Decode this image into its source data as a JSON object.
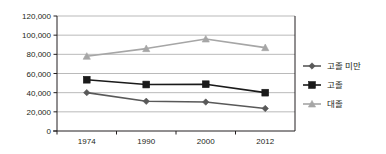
{
  "chart_data": {
    "type": "line",
    "title": "",
    "xlabel": "",
    "ylabel": "",
    "categories": [
      "1974",
      "1990",
      "2000",
      "2012"
    ],
    "ylim": [
      0,
      120000
    ],
    "ytick_values": [
      0,
      20000,
      40000,
      60000,
      80000,
      100000,
      120000
    ],
    "ytick_labels": [
      "0",
      "20,000",
      "40,000",
      "60,000",
      "80,000",
      "100,000",
      "120,000"
    ],
    "grid": true,
    "legend_position": "right",
    "series": [
      {
        "name": "고졸 미만",
        "marker": "diamond",
        "color": "#595959",
        "values": [
          40000,
          31000,
          30200,
          23500
        ]
      },
      {
        "name": "고졸",
        "marker": "square",
        "color": "#1a1a1a",
        "values": [
          53500,
          48500,
          48800,
          40000
        ]
      },
      {
        "name": "대졸",
        "marker": "triangle",
        "color": "#a6a6a6",
        "values": [
          78000,
          86000,
          96000,
          87000
        ]
      }
    ]
  },
  "axis": {
    "y_labels": [
      "120,000",
      "100,000",
      "80,000",
      "60,000",
      "40,000",
      "20,000",
      "0"
    ],
    "x_labels": [
      "1974",
      "1990",
      "2000",
      "2012"
    ]
  },
  "legend": {
    "items": [
      {
        "label": "고졸 미만",
        "marker": "diamond-marker-icon"
      },
      {
        "label": "고졸",
        "marker": "square-marker-icon"
      },
      {
        "label": "대졸",
        "marker": "triangle-marker-icon"
      }
    ]
  },
  "colors": {
    "axis": "#231f20",
    "grid": "#8c8c8c",
    "series_below_highschool": "#595959",
    "series_highschool": "#1a1a1a",
    "series_college": "#a6a6a6",
    "background": "#ffffff"
  }
}
